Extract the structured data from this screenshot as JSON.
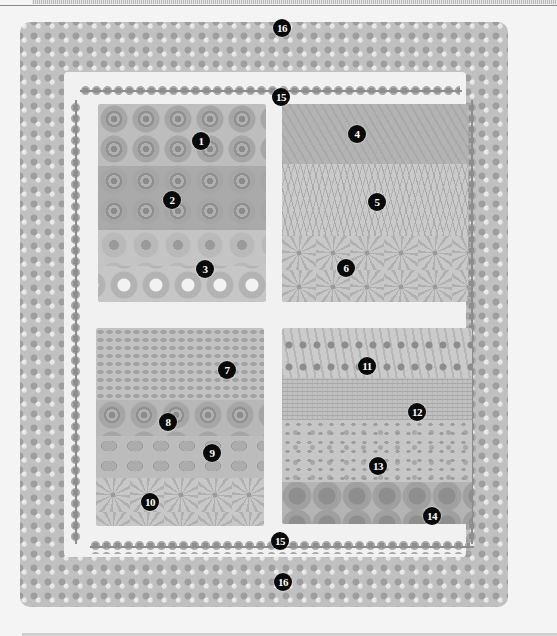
{
  "figure": {
    "type": "garden-plan-illustration",
    "style": "grayscale pencil drawing",
    "colors": {
      "background": "#f4f4f4",
      "marker_fill": "#0a0a0a",
      "marker_text": "#ffffff",
      "path": "#f1f1f1"
    }
  },
  "beds": [
    {
      "id": "top-left",
      "bands": [
        "roses",
        "roses",
        "daisies",
        "white-daisies"
      ]
    },
    {
      "id": "top-right",
      "bands": [
        "leafy",
        "grassy",
        "spiky"
      ]
    },
    {
      "id": "bottom-left",
      "bands": [
        "small-leaf",
        "roses",
        "big-leaf",
        "spiky"
      ]
    },
    {
      "id": "bottom-right",
      "bands": [
        "dotted-rows",
        "fine",
        "speckled",
        "dense"
      ]
    }
  ],
  "markers": [
    {
      "label": "16",
      "x": 282,
      "y": 28
    },
    {
      "label": "15",
      "x": 281,
      "y": 97
    },
    {
      "label": "1",
      "x": 201,
      "y": 141
    },
    {
      "label": "2",
      "x": 172,
      "y": 200
    },
    {
      "label": "3",
      "x": 205,
      "y": 269
    },
    {
      "label": "4",
      "x": 357,
      "y": 134
    },
    {
      "label": "5",
      "x": 377,
      "y": 202
    },
    {
      "label": "6",
      "x": 346,
      "y": 268
    },
    {
      "label": "7",
      "x": 227,
      "y": 370
    },
    {
      "label": "8",
      "x": 168,
      "y": 422
    },
    {
      "label": "9",
      "x": 212,
      "y": 453
    },
    {
      "label": "10",
      "x": 150,
      "y": 502
    },
    {
      "label": "11",
      "x": 367,
      "y": 366
    },
    {
      "label": "12",
      "x": 417,
      "y": 412
    },
    {
      "label": "13",
      "x": 378,
      "y": 466
    },
    {
      "label": "14",
      "x": 432,
      "y": 516
    },
    {
      "label": "15",
      "x": 280,
      "y": 541
    },
    {
      "label": "16",
      "x": 283,
      "y": 582
    }
  ]
}
